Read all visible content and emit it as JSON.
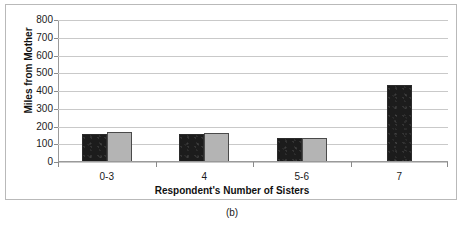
{
  "figure": {
    "caption": "(b)"
  },
  "chart_data": {
    "type": "bar",
    "title": "",
    "xlabel": "Respondent's Number of Sisters",
    "ylabel": "Miles from Mother",
    "categories": [
      "0-3",
      "4",
      "5-6",
      "7"
    ],
    "series": [
      {
        "name": "series-1",
        "color": "#1c1c1c",
        "values": [
          150,
          152,
          128,
          430
        ]
      },
      {
        "name": "series-2",
        "color": "#b4b4b4",
        "values": [
          165,
          160,
          132,
          null
        ]
      }
    ],
    "ylim": [
      0,
      800
    ],
    "ytick_labels": [
      "800",
      "700",
      "600",
      "500",
      "400",
      "300",
      "200",
      "100",
      "0"
    ],
    "ytick_values": [
      800,
      700,
      600,
      500,
      400,
      300,
      200,
      100,
      0
    ],
    "grid": true,
    "legend": "none"
  }
}
